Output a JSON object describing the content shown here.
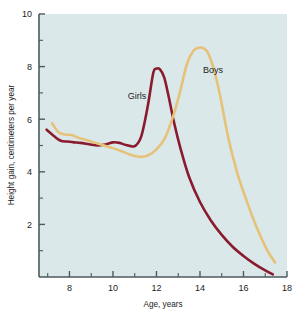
{
  "chart_data": {
    "type": "line",
    "title": "",
    "xlabel": "Age, years",
    "ylabel": "Height gain, centimeters per year",
    "xlim": [
      6.6,
      18
    ],
    "ylim": [
      0,
      10
    ],
    "xticks": [
      8,
      10,
      12,
      14,
      16,
      18
    ],
    "xticklabels": [
      "8",
      "10",
      "12",
      "14",
      "16",
      "18"
    ],
    "xminorticks": [
      7,
      9,
      11,
      13,
      15,
      17
    ],
    "yticks": [
      2,
      4,
      6,
      8,
      10
    ],
    "yticklabels": [
      "2",
      "4",
      "6",
      "8",
      "10"
    ],
    "yminorticks": [
      1,
      3,
      5,
      7,
      9
    ],
    "grid": false,
    "plot_background": "#dbe8ea",
    "legend_position": "inline-annotations",
    "series": [
      {
        "name": "Girls",
        "color": "#8a1b2e",
        "label_x": 11.1,
        "label_y": 6.75,
        "x": [
          6.95,
          7.3,
          7.6,
          7.9,
          8.2,
          8.5,
          8.9,
          9.3,
          9.7,
          10.0,
          10.3,
          10.6,
          11.0,
          11.3,
          11.6,
          11.85,
          12.0,
          12.15,
          12.35,
          12.55,
          12.8,
          13.1,
          13.5,
          14.0,
          14.5,
          15.0,
          15.5,
          16.0,
          16.5,
          17.0,
          17.35
        ],
        "y": [
          5.6,
          5.35,
          5.18,
          5.15,
          5.12,
          5.1,
          5.05,
          5.0,
          5.05,
          5.12,
          5.1,
          5.02,
          4.98,
          5.35,
          6.5,
          7.75,
          7.92,
          7.9,
          7.6,
          6.9,
          5.9,
          4.9,
          3.8,
          2.85,
          2.15,
          1.6,
          1.15,
          0.8,
          0.5,
          0.25,
          0.1
        ]
      },
      {
        "name": "Boys",
        "color": "#e6c279",
        "label_x": 14.6,
        "label_y": 7.75,
        "x": [
          7.2,
          7.5,
          7.8,
          8.1,
          8.4,
          8.8,
          9.2,
          9.6,
          10.0,
          10.4,
          10.8,
          11.2,
          11.6,
          12.0,
          12.4,
          12.8,
          13.1,
          13.4,
          13.7,
          13.95,
          14.15,
          14.35,
          14.6,
          14.9,
          15.3,
          15.7,
          16.1,
          16.6,
          17.1,
          17.45
        ],
        "y": [
          5.85,
          5.5,
          5.42,
          5.4,
          5.3,
          5.2,
          5.1,
          5.0,
          4.9,
          4.78,
          4.65,
          4.57,
          4.62,
          4.85,
          5.3,
          6.2,
          7.1,
          8.1,
          8.6,
          8.72,
          8.7,
          8.55,
          8.0,
          7.0,
          5.3,
          4.0,
          3.0,
          1.9,
          1.0,
          0.55
        ]
      }
    ]
  },
  "axis": {
    "ylabel": "Height gain, centimeters per year",
    "xlabel": "Age, years"
  },
  "colors": {
    "plot_bg": "#dbe8ea",
    "axis": "#4d5a5c",
    "girls": "#8a1b2e",
    "boys": "#e6c279",
    "text": "#1c1c1c",
    "page_bg": "#ffffff",
    "caption_ghost": "#d9d9d9"
  }
}
